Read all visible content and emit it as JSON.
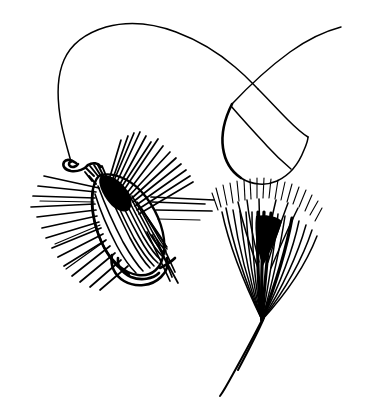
{
  "image": {
    "title": "Artificial fishing fly with leader line and feather",
    "medium": "pen-and-ink line drawing",
    "width": 367,
    "height": 412,
    "background_color": "#ffffff",
    "ink_color": "#000000"
  },
  "elements": {
    "leader": {
      "name": "fishing leader line",
      "description": "thin curved monofilament line sweeping from the hook eye up and over to the right, crossing itself to form an open loop"
    },
    "loop": {
      "name": "line loop",
      "description": "teardrop shaped loop formed where the leader crosses over itself at upper right"
    },
    "hook_eye": {
      "name": "hook eye",
      "description": "small closed wire ring at the head of the fly where the leader is tied"
    },
    "thread_wraps": {
      "name": "thread wraps",
      "description": "short parallel wraps of tying thread behind the hook eye"
    },
    "fly_body": {
      "name": "fly body",
      "description": "ovoid striped body of the artificial fly with dark shading at the shoulder"
    },
    "hackle": {
      "name": "hackle fibers",
      "description": "stiff fibers radiating outward from the fly's shoulder in all directions"
    },
    "hook_bend": {
      "name": "hook bend",
      "description": "curved wire hook bend and point emerging below the fly body"
    },
    "feather": {
      "name": "feather hackle fan",
      "description": "separate fan-shaped feather at the right with splayed barbs converging to a single quill"
    },
    "quill": {
      "name": "feather quill",
      "description": "tapering stem of the feather running down and to the left"
    }
  },
  "colors": {
    "ink": "#000000",
    "paper": "#ffffff"
  }
}
